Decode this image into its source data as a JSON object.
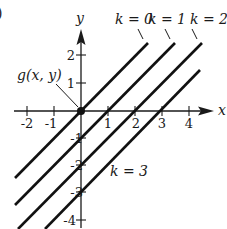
{
  "diagram": {
    "type": "level-curves",
    "axes": {
      "x_label": "x",
      "y_label": "y",
      "x_ticks": [
        "-2",
        "-1",
        "1",
        "2",
        "3",
        "4"
      ],
      "y_ticks": [
        "2",
        "1",
        "-1",
        "-2",
        "-3",
        "-4"
      ]
    },
    "point_label": "g(x, y)",
    "level_curves": [
      {
        "label": "k = 0",
        "equation": "y = x"
      },
      {
        "label": "k = 1",
        "equation": "y = x - 1"
      },
      {
        "label": "k = 2",
        "equation": "y = x - 2"
      },
      {
        "label": "k = 3",
        "equation": "y = x - 3"
      }
    ],
    "edge_fragment": ")"
  }
}
